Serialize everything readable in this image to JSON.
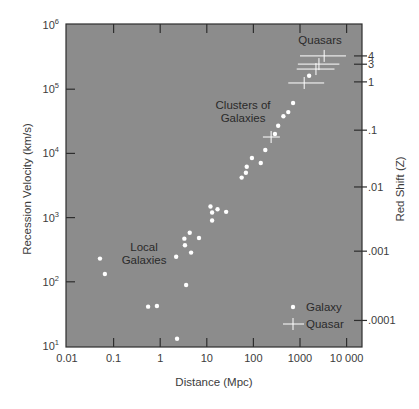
{
  "chart_data": {
    "type": "scatter",
    "title": "",
    "xlabel": "Distance (Mpc)",
    "ylabel": "Recession Velocity (km/s)",
    "ylabel_right": "Red Shift (Z)",
    "xscale": "log",
    "yscale": "log",
    "xlim": [
      0.01,
      30000
    ],
    "ylim": [
      10,
      1000000
    ],
    "x_ticks": [
      {
        "value": 0.01,
        "label": "0.01"
      },
      {
        "value": 0.1,
        "label": "0.1"
      },
      {
        "value": 1,
        "label": "1"
      },
      {
        "value": 10,
        "label": "10"
      },
      {
        "value": 100,
        "label": "100"
      },
      {
        "value": 1000,
        "label": "1000"
      },
      {
        "value": 10000,
        "label": "10 000"
      }
    ],
    "y_ticks": [
      {
        "value": 10,
        "base": "10",
        "exp": "1"
      },
      {
        "value": 100,
        "base": "10",
        "exp": "2"
      },
      {
        "value": 1000,
        "base": "10",
        "exp": "3"
      },
      {
        "value": 10000,
        "base": "10",
        "exp": "4"
      },
      {
        "value": 100000,
        "base": "10",
        "exp": "5"
      },
      {
        "value": 1000000,
        "base": "10",
        "exp": "6"
      }
    ],
    "right_ticks": [
      {
        "velocity": 330000,
        "label": "4"
      },
      {
        "velocity": 245000,
        "label": "3"
      },
      {
        "velocity": 130000,
        "label": "1"
      },
      {
        "velocity": 23000,
        "label": ".1"
      },
      {
        "velocity": 3000,
        "label": ".01"
      },
      {
        "velocity": 300,
        "label": ".001"
      },
      {
        "velocity": 25,
        "label": ".0001"
      }
    ],
    "grid": false,
    "legend_position": "lower right",
    "series": [
      {
        "name": "Galaxy",
        "marker": "dot",
        "points": [
          {
            "x": 0.051,
            "y": 230
          },
          {
            "x": 0.065,
            "y": 132
          },
          {
            "x": 0.55,
            "y": 41
          },
          {
            "x": 0.85,
            "y": 42
          },
          {
            "x": 2.3,
            "y": 13
          },
          {
            "x": 3.6,
            "y": 89
          },
          {
            "x": 2.2,
            "y": 245
          },
          {
            "x": 4.6,
            "y": 285
          },
          {
            "x": 3.4,
            "y": 370
          },
          {
            "x": 6.8,
            "y": 480
          },
          {
            "x": 3.3,
            "y": 470
          },
          {
            "x": 4.3,
            "y": 580
          },
          {
            "x": 13,
            "y": 900
          },
          {
            "x": 26,
            "y": 1230
          },
          {
            "x": 13,
            "y": 1200
          },
          {
            "x": 17,
            "y": 1350
          },
          {
            "x": 12,
            "y": 1490
          },
          {
            "x": 56,
            "y": 4200
          },
          {
            "x": 69,
            "y": 5000
          },
          {
            "x": 72,
            "y": 6200
          },
          {
            "x": 144,
            "y": 7100
          },
          {
            "x": 93,
            "y": 8500
          },
          {
            "x": 180,
            "y": 11300
          },
          {
            "x": 290,
            "y": 20000
          },
          {
            "x": 340,
            "y": 27000
          },
          {
            "x": 440,
            "y": 38000
          },
          {
            "x": 560,
            "y": 44000
          },
          {
            "x": 710,
            "y": 61000
          },
          {
            "x": 1570,
            "y": 162000
          }
        ]
      },
      {
        "name": "Quasar",
        "marker": "cross-errorbar",
        "points": [
          {
            "x": 240,
            "y": 18000,
            "xmin": 160,
            "xmax": 370
          },
          {
            "x": 1230,
            "y": 125000,
            "xmin": 560,
            "xmax": 3300
          },
          {
            "x": 2200,
            "y": 206000,
            "xmin": 850,
            "xmax": 5500
          },
          {
            "x": 2550,
            "y": 246000,
            "xmin": 900,
            "xmax": 7000
          },
          {
            "x": 3300,
            "y": 330000,
            "xmin": 1000,
            "xmax": 9700
          }
        ]
      }
    ],
    "annotations": [
      {
        "text": "Quasars",
        "lines": [
          "Quasars"
        ],
        "x": 2700,
        "y": 500000
      },
      {
        "text": "Clusters of Galaxies",
        "lines": [
          "Clusters of",
          "Galaxies"
        ],
        "x": 60,
        "y": 50000
      },
      {
        "text": "Local Galaxies",
        "lines": [
          "Local",
          "Galaxies"
        ],
        "x": 0.45,
        "y": 300
      }
    ],
    "legend": [
      {
        "label": "Galaxy",
        "marker": "dot"
      },
      {
        "label": "Quasar",
        "marker": "cross"
      }
    ]
  },
  "style": {
    "plot_bg": "#8c8c8c",
    "marker_color": "#ffffff",
    "axis_color": "#2e2e2e"
  }
}
